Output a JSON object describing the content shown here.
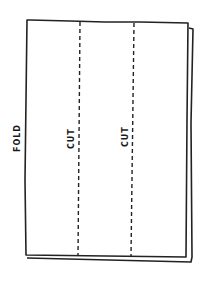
{
  "diagram": {
    "labels": {
      "fold": "FOLD",
      "cut1": "CUT",
      "cut2": "CUT"
    },
    "colors": {
      "stroke": "#222222",
      "background": "#ffffff"
    }
  }
}
